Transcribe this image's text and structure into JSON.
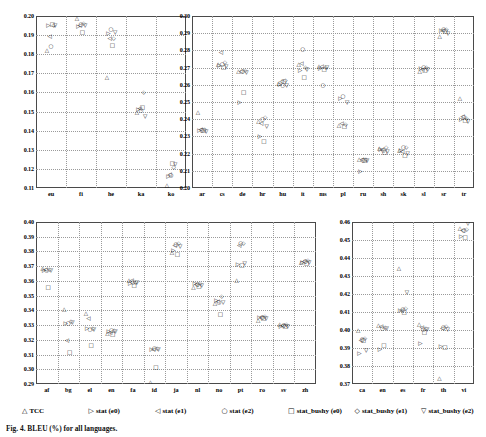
{
  "figure": {
    "caption": "Fig. 4.  BLEU (%) for all languages."
  },
  "legend": {
    "items": [
      {
        "marker": "△",
        "label": "TCC"
      },
      {
        "marker": "▷",
        "label": "stat (e0)"
      },
      {
        "marker": "◁",
        "label": "stat (e1)"
      },
      {
        "marker": "○",
        "label": "stat (e2)"
      },
      {
        "marker": "□",
        "label": "stat_bushy (e0)"
      },
      {
        "marker": "◇",
        "label": "stat_bushy (e1)"
      },
      {
        "marker": "▽",
        "label": "stat_bushy (e2)"
      }
    ]
  },
  "chart_data": [
    {
      "id": "panel-top-left",
      "type": "scatter",
      "title": "",
      "xlabel": "",
      "ylabel": "",
      "ylim": [
        0.11,
        0.2
      ],
      "yticks": [
        "0.11",
        "0.12",
        "0.13",
        "0.14",
        "0.15",
        "0.16",
        "0.17",
        "0.18",
        "0.19",
        "0.20"
      ],
      "categories": [
        "eu",
        "fi",
        "he",
        "ka",
        "ko"
      ],
      "grid": true,
      "legend_position": "below-figure",
      "series": [
        {
          "name": "TCC",
          "marker": "△",
          "values": [
            0.1815,
            0.1985,
            0.1675,
            0.149,
            0.111
          ]
        },
        {
          "name": "stat (e0)",
          "marker": "▷",
          "values": [
            0.195,
            0.1945,
            0.1905,
            0.1508,
            0.116
          ]
        },
        {
          "name": "stat (e1)",
          "marker": "◁",
          "values": [
            0.189,
            0.195,
            0.188,
            0.1512,
            0.1168
          ]
        },
        {
          "name": "stat (e2)",
          "marker": "○",
          "values": [
            0.184,
            0.1955,
            0.1925,
            0.1505,
            0.1163
          ]
        },
        {
          "name": "stat_bushy (e0)",
          "marker": "□",
          "values": [
            0.1953,
            0.191,
            0.1845,
            0.152,
            0.1225
          ]
        },
        {
          "name": "stat_bushy (e1)",
          "marker": "◇",
          "values": [
            0.195,
            0.196,
            0.188,
            0.1598,
            0.1205
          ]
        },
        {
          "name": "stat_bushy (e2)",
          "marker": "▽",
          "values": [
            0.1948,
            0.1948,
            0.1912,
            0.147,
            0.1218
          ]
        }
      ]
    },
    {
      "id": "panel-top-right",
      "type": "scatter",
      "title": "",
      "xlabel": "",
      "ylabel": "",
      "ylim": [
        0.2,
        0.3
      ],
      "yticks": [
        "0.20",
        "0.21",
        "0.22",
        "0.23",
        "0.24",
        "0.25",
        "0.26",
        "0.27",
        "0.28",
        "0.29",
        "0.30"
      ],
      "categories": [
        "ar",
        "cs",
        "de",
        "hr",
        "hu",
        "it",
        "ms",
        "pl",
        "ru",
        "sh",
        "sk",
        "sl",
        "sr",
        "tr"
      ],
      "grid": true,
      "legend_position": "below-figure",
      "series": [
        {
          "name": "TCC",
          "marker": "△",
          "values": [
            0.2435,
            0.2715,
            0.2675,
            0.2385,
            0.2605,
            0.2715,
            0.2705,
            0.236,
            0.216,
            0.2225,
            0.2215,
            0.2675,
            0.288,
            0.252
          ]
        },
        {
          "name": "stat (e0)",
          "marker": "▷",
          "values": [
            0.233,
            0.271,
            0.2495,
            0.2295,
            0.26,
            0.2678,
            0.269,
            0.2518,
            0.2095,
            0.2222,
            0.2215,
            0.269,
            0.291,
            0.2395
          ]
        },
        {
          "name": "stat (e1)",
          "marker": "◁",
          "values": [
            0.2335,
            0.2782,
            0.2675,
            0.2375,
            0.2615,
            0.2722,
            0.2705,
            0.2373,
            0.2163,
            0.222,
            0.2212,
            0.2688,
            0.2912,
            0.2412
          ]
        },
        {
          "name": "stat (e2)",
          "marker": "○",
          "values": [
            0.233,
            0.2718,
            0.2672,
            0.2398,
            0.2595,
            0.2805,
            0.2592,
            0.253,
            0.2158,
            0.2218,
            0.2232,
            0.27,
            0.2918,
            0.2405
          ]
        },
        {
          "name": "stat_bushy (e0)",
          "marker": "□",
          "values": [
            0.2332,
            0.27,
            0.2555,
            0.2265,
            0.2615,
            0.2638,
            0.2688,
            0.2352,
            0.2155,
            0.2205,
            0.2188,
            0.2678,
            0.2905,
            0.239
          ]
        },
        {
          "name": "stat_bushy (e1)",
          "marker": "◇",
          "values": [
            0.234,
            0.2725,
            0.2678,
            0.2408,
            0.262,
            0.27,
            0.2695,
            0.2368,
            0.2162,
            0.2235,
            0.223,
            0.2695,
            0.292,
            0.24
          ]
        },
        {
          "name": "stat_bushy (e2)",
          "marker": "▽",
          "values": [
            0.2325,
            0.2705,
            0.2668,
            0.2352,
            0.2592,
            0.2688,
            0.27,
            0.2492,
            0.2157,
            0.2212,
            0.2195,
            0.2685,
            0.2898,
            0.2385
          ]
        }
      ]
    },
    {
      "id": "panel-bottom-left",
      "type": "scatter",
      "title": "",
      "xlabel": "",
      "ylabel": "",
      "ylim": [
        0.29,
        0.4
      ],
      "yticks": [
        "0.29",
        "0.30",
        "0.31",
        "0.32",
        "0.33",
        "0.34",
        "0.35",
        "0.36",
        "0.37",
        "0.38",
        "0.39",
        "0.40"
      ],
      "categories": [
        "af",
        "bg",
        "el",
        "en",
        "fa",
        "id",
        "ja",
        "nl",
        "no",
        "pt",
        "ro",
        "sv",
        "zh"
      ],
      "grid": true,
      "legend_position": "below-figure",
      "series": [
        {
          "name": "TCC",
          "marker": "△",
          "values": [
            0.3682,
            0.34,
            0.3378,
            0.3242,
            0.3602,
            0.2905,
            0.379,
            0.3555,
            0.3442,
            0.36,
            0.333,
            0.33,
            0.3722
          ]
        },
        {
          "name": "stat (e0)",
          "marker": "▷",
          "values": [
            0.3668,
            0.331,
            0.3275,
            0.3255,
            0.3582,
            0.313,
            0.3805,
            0.3578,
            0.3462,
            0.3705,
            0.3348,
            0.3288,
            0.3725
          ]
        },
        {
          "name": "stat (e1)",
          "marker": "◁",
          "values": [
            0.3672,
            0.319,
            0.334,
            0.3248,
            0.36,
            0.3128,
            0.3838,
            0.3572,
            0.3455,
            0.3838,
            0.335,
            0.3292,
            0.3728
          ]
        },
        {
          "name": "stat (e2)",
          "marker": "○",
          "values": [
            0.367,
            0.331,
            0.3265,
            0.3262,
            0.3588,
            0.3135,
            0.3845,
            0.357,
            0.345,
            0.385,
            0.3345,
            0.3295,
            0.373
          ]
        },
        {
          "name": "stat_bushy (e0)",
          "marker": "□",
          "values": [
            0.3555,
            0.311,
            0.3158,
            0.3232,
            0.3565,
            0.301,
            0.3775,
            0.3562,
            0.337,
            0.37,
            0.3338,
            0.3285,
            0.3715
          ]
        },
        {
          "name": "stat_bushy (e1)",
          "marker": "◇",
          "values": [
            0.3675,
            0.3318,
            0.3272,
            0.3258,
            0.3588,
            0.3138,
            0.385,
            0.3582,
            0.3488,
            0.3852,
            0.3352,
            0.3298,
            0.3735
          ]
        },
        {
          "name": "stat_bushy (e2)",
          "marker": "▽",
          "values": [
            0.3665,
            0.3315,
            0.3268,
            0.3252,
            0.3585,
            0.3132,
            0.3832,
            0.3568,
            0.3448,
            0.3715,
            0.3342,
            0.329,
            0.372
          ]
        }
      ]
    },
    {
      "id": "panel-bottom-right",
      "type": "scatter",
      "title": "",
      "xlabel": "",
      "ylabel": "",
      "ylim": [
        0.37,
        0.46
      ],
      "yticks": [
        "0.37",
        "0.38",
        "0.39",
        "0.40",
        "0.41",
        "0.42",
        "0.43",
        "0.44",
        "0.45",
        "0.46"
      ],
      "categories": [
        "ca",
        "en",
        "es",
        "fr",
        "th",
        "vi"
      ],
      "grid": true,
      "legend_position": "below-figure",
      "series": [
        {
          "name": "TCC",
          "marker": "△",
          "values": [
            0.3995,
            0.4022,
            0.434,
            0.4028,
            0.3728,
            0.4562
          ]
        },
        {
          "name": "stat (e0)",
          "marker": "▷",
          "values": [
            0.3868,
            0.3888,
            0.4105,
            0.3922,
            0.3908,
            0.4518
          ]
        },
        {
          "name": "stat (e1)",
          "marker": "◁",
          "values": [
            0.394,
            0.4015,
            0.4108,
            0.4012,
            0.4005,
            0.4548
          ]
        },
        {
          "name": "stat (e2)",
          "marker": "○",
          "values": [
            0.3945,
            0.4008,
            0.4112,
            0.4002,
            0.401,
            0.4552
          ]
        },
        {
          "name": "stat_bushy (e0)",
          "marker": "□",
          "values": [
            0.3938,
            0.3912,
            0.4092,
            0.3985,
            0.3898,
            0.4512
          ]
        },
        {
          "name": "stat_bushy (e1)",
          "marker": "◇",
          "values": [
            0.395,
            0.401,
            0.4118,
            0.4008,
            0.4015,
            0.4555
          ]
        },
        {
          "name": "stat_bushy (e2)",
          "marker": "▽",
          "values": [
            0.3882,
            0.4005,
            0.4205,
            0.3998,
            0.3998,
            0.4588
          ]
        }
      ]
    }
  ]
}
